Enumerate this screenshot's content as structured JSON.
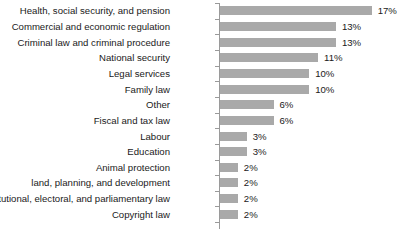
{
  "chart_data": {
    "type": "bar",
    "orientation": "horizontal",
    "title": "",
    "subtitle": "",
    "xlabel": "",
    "ylabel": "",
    "grid": false,
    "legend": false,
    "legend_position": "none",
    "axis_visible": true,
    "xlim": [
      0,
      19
    ],
    "value_suffix": "%",
    "bar_color": "#a9a9a9",
    "axis_color": "#9a9a9a",
    "text_color": "#1a1a1a",
    "background_color": "#ffffff",
    "categories": [
      "Health, social security, and pension",
      "Commercial and economic regulation",
      "Criminal law and criminal procedure",
      "National security",
      "Legal services",
      "Family law",
      "Other",
      "Fiscal and tax law",
      "Labour",
      "Education",
      "Animal protection",
      "land, planning, and development",
      "Constitutional, electoral, and parliamentary law",
      "Copyright law"
    ],
    "values": [
      17,
      13,
      13,
      11,
      10,
      10,
      6,
      6,
      3,
      3,
      2,
      2,
      2,
      2
    ],
    "value_labels": [
      "17%",
      "13%",
      "13%",
      "11%",
      "10%",
      "10%",
      "6%",
      "6%",
      "3%",
      "3%",
      "2%",
      "2%",
      "2%",
      "2%"
    ]
  }
}
